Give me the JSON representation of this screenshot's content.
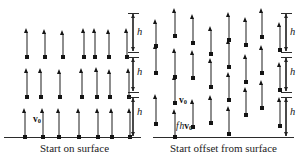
{
  "figure": {
    "width": 298,
    "height": 161,
    "background": "#ffffff",
    "arrow_shaft_color": "#8e8e8e",
    "arrow_head_color": "#141414",
    "surface_color": "#2b2b2b"
  },
  "panels": [
    {
      "id": "left",
      "caption": "Start on surface",
      "caption_x": 74,
      "caption_y": 142,
      "surface": {
        "x": 4,
        "y": 137,
        "width": 137
      },
      "labels": [
        {
          "name": "v0",
          "html": "v0",
          "x": 33,
          "y": 115
        }
      ],
      "scale": {
        "x": 133,
        "label": "h",
        "label_x": 137,
        "ticks_y": [
          13,
          52,
          57,
          92,
          97,
          137
        ],
        "spans": [
          {
            "top": 14,
            "bottom": 51,
            "label_y": 27
          },
          {
            "top": 58,
            "bottom": 91,
            "label_y": 67
          },
          {
            "top": 98,
            "bottom": 136,
            "label_y": 107
          }
        ]
      },
      "arrows": [
        {
          "x": 27,
          "top": 32,
          "bottom": 57
        },
        {
          "x": 45,
          "top": 33,
          "bottom": 57
        },
        {
          "x": 63,
          "top": 34,
          "bottom": 57
        },
        {
          "x": 84,
          "top": 32,
          "bottom": 57
        },
        {
          "x": 95,
          "top": 32,
          "bottom": 57
        },
        {
          "x": 109,
          "top": 33,
          "bottom": 57
        },
        {
          "x": 127,
          "top": 32,
          "bottom": 57
        },
        {
          "x": 27,
          "top": 72,
          "bottom": 97
        },
        {
          "x": 41,
          "top": 72,
          "bottom": 97
        },
        {
          "x": 60,
          "top": 73,
          "bottom": 97
        },
        {
          "x": 82,
          "top": 72,
          "bottom": 97
        },
        {
          "x": 97,
          "top": 71,
          "bottom": 97
        },
        {
          "x": 110,
          "top": 73,
          "bottom": 97
        },
        {
          "x": 129,
          "top": 72,
          "bottom": 97
        },
        {
          "x": 25,
          "top": 112,
          "bottom": 137
        },
        {
          "x": 43,
          "top": 112,
          "bottom": 137
        },
        {
          "x": 59,
          "top": 112,
          "bottom": 137
        },
        {
          "x": 79,
          "top": 112,
          "bottom": 137
        },
        {
          "x": 98,
          "top": 112,
          "bottom": 137
        },
        {
          "x": 112,
          "top": 112,
          "bottom": 137
        },
        {
          "x": 130,
          "top": 112,
          "bottom": 137
        }
      ]
    },
    {
      "id": "right",
      "caption": "Start offset from surface",
      "caption_x": 74,
      "caption_y": 142,
      "surface": {
        "x": 4,
        "y": 137,
        "width": 141
      },
      "labels": [
        {
          "name": "v0",
          "html": "v0",
          "x": 30,
          "y": 96
        },
        {
          "name": "fhv0",
          "html": "fhv0",
          "x": 27,
          "y": 122
        }
      ],
      "scale": {
        "x": 137,
        "label": "h",
        "label_x": 141,
        "ticks_y": [
          13,
          52,
          57,
          92,
          97,
          137
        ],
        "spans": [
          {
            "top": 14,
            "bottom": 51,
            "label_y": 27
          },
          {
            "top": 58,
            "bottom": 91,
            "label_y": 67
          },
          {
            "top": 98,
            "bottom": 136,
            "label_y": 107
          }
        ]
      },
      "arrows": [
        {
          "x": 7,
          "top": 23,
          "bottom": 46
        },
        {
          "x": 7,
          "top": 48,
          "bottom": 73
        },
        {
          "x": 7,
          "top": 98,
          "bottom": 124
        },
        {
          "x": 26,
          "top": 12,
          "bottom": 36
        },
        {
          "x": 26,
          "top": 52,
          "bottom": 77
        },
        {
          "x": 26,
          "top": 79,
          "bottom": 103
        },
        {
          "x": 26,
          "top": 113,
          "bottom": 137
        },
        {
          "x": 44,
          "top": 18,
          "bottom": 43
        },
        {
          "x": 44,
          "top": 54,
          "bottom": 78
        },
        {
          "x": 44,
          "top": 103,
          "bottom": 127
        },
        {
          "x": 62,
          "top": 30,
          "bottom": 54
        },
        {
          "x": 62,
          "top": 62,
          "bottom": 87
        },
        {
          "x": 62,
          "top": 99,
          "bottom": 123
        },
        {
          "x": 80,
          "top": 16,
          "bottom": 40
        },
        {
          "x": 80,
          "top": 43,
          "bottom": 67
        },
        {
          "x": 80,
          "top": 76,
          "bottom": 100
        },
        {
          "x": 80,
          "top": 110,
          "bottom": 134
        },
        {
          "x": 97,
          "top": 21,
          "bottom": 45
        },
        {
          "x": 97,
          "top": 58,
          "bottom": 82
        },
        {
          "x": 97,
          "top": 91,
          "bottom": 115
        },
        {
          "x": 113,
          "top": 12,
          "bottom": 37
        },
        {
          "x": 113,
          "top": 49,
          "bottom": 73
        },
        {
          "x": 113,
          "top": 84,
          "bottom": 108
        },
        {
          "x": 131,
          "top": 26,
          "bottom": 50
        },
        {
          "x": 131,
          "top": 66,
          "bottom": 90
        },
        {
          "x": 131,
          "top": 101,
          "bottom": 126
        }
      ]
    }
  ]
}
